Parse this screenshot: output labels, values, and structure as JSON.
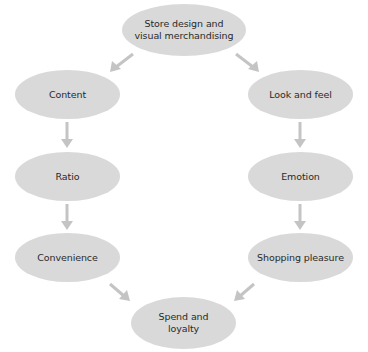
{
  "diagram": {
    "colors": {
      "node_fill": "#d9d9d9",
      "arrow": "#c4c4c4",
      "text": "#2a2a2a",
      "background": "#ffffff"
    },
    "nodes": {
      "top": {
        "line1": "Store design and",
        "line2": "visual merchandising"
      },
      "content": {
        "label": "Content"
      },
      "ratio": {
        "label": "Ratio"
      },
      "convenience": {
        "label": "Convenience"
      },
      "look_and_feel": {
        "label": "Look and feel"
      },
      "emotion": {
        "label": "Emotion"
      },
      "shopping_pleasure": {
        "label": "Shopping pleasure"
      },
      "bottom": {
        "line1": "Spend and",
        "line2": "loyalty"
      }
    },
    "edges": [
      {
        "from": "Store design and visual merchandising",
        "to": "Content"
      },
      {
        "from": "Store design and visual merchandising",
        "to": "Look and feel"
      },
      {
        "from": "Content",
        "to": "Ratio"
      },
      {
        "from": "Ratio",
        "to": "Convenience"
      },
      {
        "from": "Convenience",
        "to": "Spend and loyalty"
      },
      {
        "from": "Look and feel",
        "to": "Emotion"
      },
      {
        "from": "Emotion",
        "to": "Shopping pleasure"
      },
      {
        "from": "Shopping pleasure",
        "to": "Spend and loyalty"
      }
    ]
  }
}
